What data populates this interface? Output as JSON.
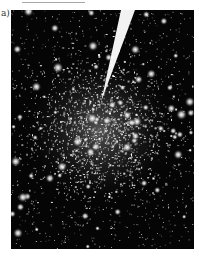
{
  "figure": {
    "panel_label": "a)",
    "features": [
      "dense star field",
      "bright cluster core",
      "bright diagonal streak"
    ],
    "background_color": "#050505",
    "star_color": "#ffffff",
    "streak_color": "#ffffff"
  }
}
